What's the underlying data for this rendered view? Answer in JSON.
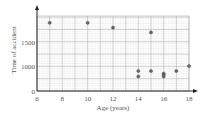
{
  "chart_data": {
    "type": "scatter",
    "title": "",
    "xlabel": "Age (years)",
    "ylabel": "Time of accident",
    "xlim": [
      6,
      18
    ],
    "ylim": [
      0,
      2000
    ],
    "x_ticks": [
      "6",
      "8",
      "10",
      "12",
      "14",
      "16",
      "18"
    ],
    "y_ticks": [
      "0",
      "1000",
      "1500"
    ],
    "grid": true,
    "points": [
      {
        "x": 7,
        "y": 1900
      },
      {
        "x": 10,
        "y": 1900
      },
      {
        "x": 12,
        "y": 1800
      },
      {
        "x": 15,
        "y": 1700
      },
      {
        "x": 18,
        "y": 1000
      },
      {
        "x": 14,
        "y": 800
      },
      {
        "x": 15,
        "y": 800
      },
      {
        "x": 17,
        "y": 800
      },
      {
        "x": 16,
        "y": 700
      },
      {
        "x": 16,
        "y": 650
      },
      {
        "x": 14,
        "y": 580
      },
      {
        "x": 16,
        "y": 580
      }
    ]
  }
}
